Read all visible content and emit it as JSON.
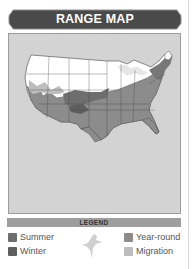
{
  "header": {
    "title": "RANGE MAP",
    "bg_color": "#4a4a4a"
  },
  "map": {
    "region": "United States",
    "background_color": "#d3d3d3",
    "land_unoccupied_color": "#ffffff",
    "great_lakes_color": "#e6e6e6"
  },
  "legend": {
    "title": "LEGEND",
    "items": [
      {
        "label": "Summer",
        "color": "#6e6e6e"
      },
      {
        "label": "Winter",
        "color": "#5e5e5e"
      },
      {
        "label": "Year-round",
        "color": "#8c8c8c"
      },
      {
        "label": "Migration",
        "color": "#bdbdbd"
      }
    ],
    "icon": "bird-silhouette-icon"
  }
}
